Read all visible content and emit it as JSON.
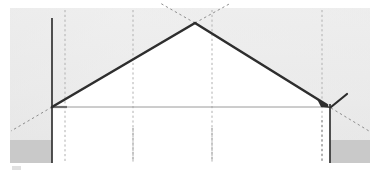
{
  "canvas": {
    "width": 379,
    "height": 173,
    "page_background": "#ffffff",
    "panel_background_top": "#ececec",
    "panel_background_bottom": "#e4e4e4",
    "panel": {
      "x": 10,
      "y": 8,
      "width": 360,
      "height": 155
    }
  },
  "palette": {
    "structure_line": "#2e2e2e",
    "thin_rule": "#9a9a9a",
    "dashed_guide": "#b3b3b3",
    "dashed_guide_dark": "#7d7d7d",
    "support_block": "#c9c9c9",
    "white_fill": "#ffffff",
    "panel_light": "#ededed",
    "panel_shade": "#e2e2e2"
  },
  "diagram": {
    "type": "line-diagram",
    "apex": {
      "x": 195,
      "y": 23,
      "label": "apex"
    },
    "left_eave": {
      "x": 52,
      "y": 107,
      "label": "left-eave"
    },
    "right_eave": {
      "x": 330,
      "y": 107,
      "label": "right-eave"
    },
    "rafters": [
      {
        "name": "left-rafter",
        "from": [
          52,
          107
        ],
        "to": [
          195,
          23
        ],
        "weight": 2.6
      },
      {
        "name": "right-rafter",
        "from": [
          195,
          23
        ],
        "to": [
          330,
          107
        ],
        "weight": 2.6
      }
    ],
    "tie_beam": {
      "name": "tie-beam",
      "from": [
        52,
        107
      ],
      "to": [
        330,
        107
      ],
      "weight": 1
    },
    "posts": [
      {
        "name": "left-post",
        "x": 52,
        "from_y": 18,
        "to_y": 162,
        "weight": 1.6
      },
      {
        "name": "right-post",
        "x": 330,
        "from_y": 104,
        "to_y": 162,
        "weight": 1.6
      }
    ],
    "grid_lines": [
      {
        "name": "grid-line-1",
        "x": 65,
        "from_y": 10,
        "to_y": 162
      },
      {
        "name": "grid-line-2",
        "x": 133,
        "from_y": 10,
        "to_y": 162
      },
      {
        "name": "grid-line-3",
        "x": 212,
        "from_y": 10,
        "to_y": 162
      },
      {
        "name": "grid-line-4",
        "x": 322,
        "from_y": 10,
        "to_y": 162
      }
    ],
    "extension_lines": [
      {
        "name": "left-rafter-extension-up",
        "from": [
          195,
          23
        ],
        "to": [
          163,
          4
        ]
      },
      {
        "name": "right-rafter-extension-up",
        "from": [
          195,
          23
        ],
        "to": [
          228,
          4
        ]
      },
      {
        "name": "left-rafter-extension-down",
        "from": [
          52,
          107
        ],
        "to": [
          11,
          131
        ]
      },
      {
        "name": "right-rafter-extension-down",
        "from": [
          330,
          107
        ],
        "to": [
          369,
          131
        ]
      }
    ],
    "support_blocks": [
      {
        "name": "left-support-block",
        "x": 10,
        "y": 140,
        "width": 42,
        "height": 23
      },
      {
        "name": "right-support-block",
        "x": 330,
        "y": 140,
        "width": 40,
        "height": 23
      }
    ],
    "arrow_marker": {
      "name": "rafter-arrow-head",
      "tip": [
        330,
        107
      ],
      "direction_deg": 32,
      "size": 9
    },
    "tick_marker": {
      "name": "angle-tick",
      "from": [
        331,
        107
      ],
      "to": [
        346,
        95
      ]
    },
    "baseline_arrow": {
      "name": "tie-beam-arrow-head",
      "tip": [
        66,
        107
      ],
      "size": 4
    },
    "corner_smudge": {
      "name": "corner-smudge",
      "x": 12,
      "y": 166,
      "width": 9,
      "height": 4
    }
  }
}
